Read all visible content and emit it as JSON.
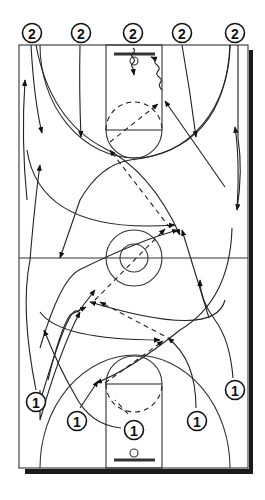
{
  "diagram": {
    "type": "basketball full-court drill",
    "colors": {
      "line": "#333333",
      "shadow": "#1a1a1a",
      "background": "#ffffff"
    },
    "court": {
      "left": 19,
      "top": 45,
      "right": 248,
      "bottom": 468,
      "midline_y": 258
    }
  },
  "players": {
    "team2": [
      {
        "label": "2",
        "x": 32,
        "y": 33
      },
      {
        "label": "2",
        "x": 81,
        "y": 33
      },
      {
        "label": "2",
        "x": 133,
        "y": 33
      },
      {
        "label": "2",
        "x": 182,
        "y": 33
      },
      {
        "label": "2",
        "x": 235,
        "y": 33
      }
    ],
    "team1": [
      {
        "label": "1",
        "x": 36,
        "y": 402
      },
      {
        "label": "1",
        "x": 77,
        "y": 421
      },
      {
        "label": "1",
        "x": 134,
        "y": 430
      },
      {
        "label": "1",
        "x": 197,
        "y": 421
      },
      {
        "label": "1",
        "x": 235,
        "y": 390
      }
    ]
  },
  "legend": {
    "solid_arrow": "player movement",
    "dashed_arrow": "pass",
    "wavy_arrow": "dribble"
  }
}
